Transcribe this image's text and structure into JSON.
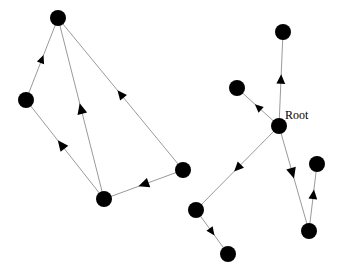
{
  "diagram": {
    "node_radius": 8,
    "colors": {
      "node": "#000000",
      "edge": "#9a9a9a",
      "arrow": "#000000",
      "background": "#ffffff"
    },
    "graphs": [
      {
        "name": "left-graph",
        "nodes": [
          {
            "id": "L1",
            "x": 58,
            "y": 18,
            "label": ""
          },
          {
            "id": "L2",
            "x": 26,
            "y": 100,
            "label": ""
          },
          {
            "id": "L3",
            "x": 104,
            "y": 199,
            "label": ""
          },
          {
            "id": "L4",
            "x": 183,
            "y": 170,
            "label": ""
          }
        ],
        "edges": [
          {
            "from": "L2",
            "to": "L1",
            "arrow_t": 0.5,
            "arrow_size": 7
          },
          {
            "from": "L3",
            "to": "L2",
            "arrow_t": 0.55,
            "arrow_size": 9
          },
          {
            "from": "L3",
            "to": "L1",
            "arrow_t": 0.5,
            "arrow_size": 9
          },
          {
            "from": "L4",
            "to": "L1",
            "arrow_t": 0.5,
            "arrow_size": 8
          },
          {
            "from": "L4",
            "to": "L3",
            "arrow_t": 0.5,
            "arrow_size": 9
          }
        ]
      },
      {
        "name": "right-graph",
        "nodes": [
          {
            "id": "Root",
            "x": 279,
            "y": 126,
            "label": "Root"
          },
          {
            "id": "R_top",
            "x": 283,
            "y": 32,
            "label": ""
          },
          {
            "id": "R_left",
            "x": 237,
            "y": 88,
            "label": ""
          },
          {
            "id": "R_far",
            "x": 317,
            "y": 164,
            "label": ""
          },
          {
            "id": "R_low",
            "x": 309,
            "y": 231,
            "label": ""
          },
          {
            "id": "R_mid",
            "x": 196,
            "y": 210,
            "label": ""
          },
          {
            "id": "R_bot",
            "x": 228,
            "y": 254,
            "label": ""
          }
        ],
        "edges": [
          {
            "from": "Root",
            "to": "R_top",
            "arrow_t": 0.5,
            "arrow_size": 8
          },
          {
            "from": "Root",
            "to": "R_left",
            "arrow_t": 0.5,
            "arrow_size": 7
          },
          {
            "from": "Root",
            "to": "R_mid",
            "arrow_t": 0.5,
            "arrow_size": 8
          },
          {
            "from": "Root",
            "to": "R_low",
            "arrow_t": 0.45,
            "arrow_size": 9
          },
          {
            "from": "R_low",
            "to": "R_far",
            "arrow_t": 0.55,
            "arrow_size": 8
          },
          {
            "from": "R_mid",
            "to": "R_bot",
            "arrow_t": 0.5,
            "arrow_size": 7
          }
        ]
      }
    ],
    "labels": [
      {
        "text": "Root",
        "x": 285,
        "y": 119,
        "for": "Root"
      }
    ]
  }
}
